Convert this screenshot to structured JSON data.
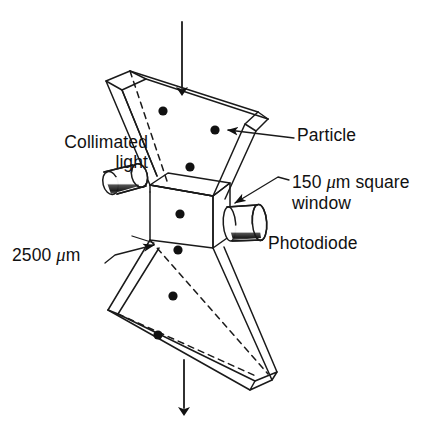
{
  "figure": {
    "background_color": "#ffffff",
    "line_color": "#1a1a1a",
    "dot_color": "#111111"
  },
  "labels": {
    "collimated_light": "Collimated light",
    "collimated_light_line1": "Collimated",
    "collimated_light_line2": "light",
    "particle": "Particle",
    "window_line1_value": "150",
    "window_mu": "μ",
    "window_line1_rest": "m square",
    "window_line2": "window",
    "window_full": "150 μm square window",
    "photodiode": "Photodiode",
    "diameter_value": "2500",
    "diameter_mu": "μ",
    "diameter_unit": "m",
    "diameter_full": "2500 μm"
  },
  "components": {
    "upper_funnel": "upper-funnel",
    "lower_funnel": "lower-funnel",
    "window_box": "window-box",
    "light_source": "collimated-light-source",
    "detector": "photodiode-detector",
    "flow_arrow_in": "flow-arrow-inlet",
    "flow_arrow_out": "flow-arrow-outlet"
  },
  "particles": {
    "count": 8,
    "positions": [
      {
        "cx": 163,
        "cy": 111,
        "r": 4.6
      },
      {
        "cx": 215,
        "cy": 130,
        "r": 4.6
      },
      {
        "cx": 190,
        "cy": 167,
        "r": 4.6
      },
      {
        "cx": 180,
        "cy": 214,
        "r": 4.6
      },
      {
        "cx": 178,
        "cy": 250,
        "r": 4.6
      },
      {
        "cx": 173,
        "cy": 296,
        "r": 4.6
      },
      {
        "cx": 158,
        "cy": 335,
        "r": 4.6
      },
      {
        "cx": 201,
        "cy": 142,
        "r": 0
      }
    ]
  },
  "dimensions": {
    "width": 434,
    "height": 429
  }
}
